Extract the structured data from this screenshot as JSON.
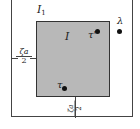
{
  "diagram": {
    "outer_region": {
      "label": "I",
      "label_sub": "1"
    },
    "inner_region": {
      "label": "I",
      "fill": "#b8b8b8"
    },
    "points": [
      {
        "name": "tau-prime",
        "label": "τ'"
      },
      {
        "name": "lambda",
        "label": "λ"
      },
      {
        "name": "tau",
        "label": "τ"
      }
    ],
    "margins": {
      "left": {
        "numerator": "ζa",
        "denominator": "2"
      },
      "bottom": {
        "numerator": "ζa",
        "denominator": "2"
      }
    }
  }
}
